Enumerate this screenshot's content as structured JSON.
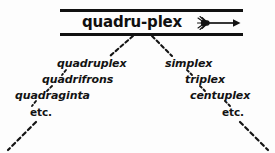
{
  "figure": {
    "type": "etymology-branching-diagram",
    "headword": {
      "label": "quadru-plex",
      "arrow_icon": "rightwards-arrow-with-frayed-tail",
      "arrow_meaning": "yields"
    },
    "ink_color": "#131313",
    "background_color": "#fdfdfd",
    "branches": [
      {
        "side": "left",
        "name": "quadru-branch",
        "items": [
          {
            "label": "quadruplex"
          },
          {
            "label": "quadrifrons"
          },
          {
            "label": "quadraginta"
          },
          {
            "label": "etc."
          }
        ]
      },
      {
        "side": "right",
        "name": "plex-branch",
        "items": [
          {
            "label": "simplex"
          },
          {
            "label": "triplex"
          },
          {
            "label": "centuplex"
          },
          {
            "label": "etc."
          }
        ]
      }
    ]
  }
}
